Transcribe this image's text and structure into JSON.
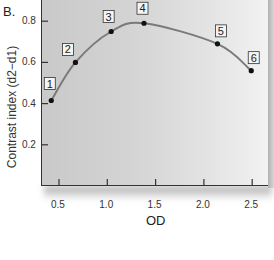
{
  "figure": {
    "panel_label": "B."
  },
  "chart_data": {
    "type": "line",
    "title": "",
    "xlabel": "OD",
    "ylabel": "Contrast index (d2−d1)",
    "xlim": [
      0.3,
      2.65
    ],
    "ylim": [
      0.0,
      0.85
    ],
    "x_ticks": [
      "0.5",
      "1.0",
      "1.5",
      "2.0",
      "2.5"
    ],
    "y_ticks": [
      "0.2",
      "0.4",
      "0.6",
      "0.8"
    ],
    "grid": false,
    "legend": null,
    "series": [
      {
        "name": "Contrast index",
        "x": [
          0.42,
          0.67,
          1.04,
          1.38,
          2.14,
          2.49
        ],
        "y": [
          0.415,
          0.6,
          0.75,
          0.79,
          0.69,
          0.56
        ],
        "point_labels": [
          "1",
          "2",
          "3",
          "4",
          "5",
          "6"
        ],
        "line_color": "#7a7a7a",
        "marker_color": "#111111"
      }
    ],
    "annotations": [
      "1",
      "2",
      "3",
      "4",
      "5",
      "6"
    ]
  }
}
